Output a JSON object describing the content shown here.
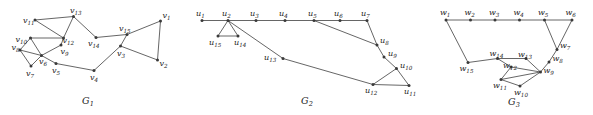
{
  "figure": {
    "width": 593,
    "height": 115,
    "background": "#ffffff",
    "edge_color": "#555555",
    "vertex_color": "#3a3a3a",
    "label_color": "#222222"
  },
  "graphs": [
    {
      "id": "G1",
      "caption_base": "G",
      "caption_sub": "1",
      "caption_x": 88,
      "caption_y": 104,
      "vertices": [
        {
          "name": "v1",
          "base": "v",
          "sub": "1",
          "x": 160.5,
          "y": 21.0,
          "lx": 162.5,
          "ly": 17.5,
          "anchor": "start"
        },
        {
          "name": "v2",
          "base": "v",
          "sub": "2",
          "x": 157.5,
          "y": 60.0,
          "lx": 159.5,
          "ly": 66.0,
          "anchor": "start"
        },
        {
          "name": "v3",
          "base": "v",
          "sub": "3",
          "x": 120.5,
          "y": 46.0,
          "lx": 117.0,
          "ly": 55.5,
          "anchor": "start"
        },
        {
          "name": "v4",
          "base": "v",
          "sub": "4",
          "x": 94.0,
          "y": 70.5,
          "lx": 90.0,
          "ly": 79.5,
          "anchor": "start"
        },
        {
          "name": "v5",
          "base": "v",
          "sub": "5",
          "x": 56.0,
          "y": 63.5,
          "lx": 52.0,
          "ly": 72.5,
          "anchor": "start"
        },
        {
          "name": "v6",
          "base": "v",
          "sub": "6",
          "x": 41.5,
          "y": 55.5,
          "lx": 39.0,
          "ly": 64.0,
          "anchor": "start"
        },
        {
          "name": "v7",
          "base": "v",
          "sub": "7",
          "x": 31.0,
          "y": 66.0,
          "lx": 26.0,
          "ly": 75.5,
          "anchor": "start"
        },
        {
          "name": "v8",
          "base": "v",
          "sub": "8",
          "x": 20.0,
          "y": 50.0,
          "lx": 11.5,
          "ly": 49.5,
          "anchor": "start"
        },
        {
          "name": "v9",
          "base": "v",
          "sub": "9",
          "x": 61.0,
          "y": 45.0,
          "lx": 60.5,
          "ly": 54.0,
          "anchor": "start"
        },
        {
          "name": "v10",
          "base": "v",
          "sub": "10",
          "x": 30.5,
          "y": 38.0,
          "lx": 15.5,
          "ly": 41.5,
          "anchor": "start"
        },
        {
          "name": "v11",
          "base": "v",
          "sub": "11",
          "x": 35.0,
          "y": 20.0,
          "lx": 23.0,
          "ly": 23.0,
          "anchor": "start"
        },
        {
          "name": "v12",
          "base": "v",
          "sub": "12",
          "x": 63.5,
          "y": 38.0,
          "lx": 62.5,
          "ly": 42.5,
          "anchor": "start"
        },
        {
          "name": "v13",
          "base": "v",
          "sub": "13",
          "x": 73.5,
          "y": 16.5,
          "lx": 70.0,
          "ly": 13.0,
          "anchor": "start"
        },
        {
          "name": "v14",
          "base": "v",
          "sub": "14",
          "x": 96.0,
          "y": 37.5,
          "lx": 88.0,
          "ly": 45.5,
          "anchor": "start"
        },
        {
          "name": "v15",
          "base": "v",
          "sub": "15",
          "x": 127.0,
          "y": 34.5,
          "lx": 119.0,
          "ly": 31.0,
          "anchor": "start"
        }
      ],
      "edges": [
        [
          "v11",
          "v13"
        ],
        [
          "v13",
          "v12"
        ],
        [
          "v11",
          "v12"
        ],
        [
          "v13",
          "v14"
        ],
        [
          "v14",
          "v15"
        ],
        [
          "v15",
          "v1"
        ],
        [
          "v1",
          "v2"
        ],
        [
          "v2",
          "v3"
        ],
        [
          "v3",
          "v15"
        ],
        [
          "v3",
          "v4"
        ],
        [
          "v4",
          "v5"
        ],
        [
          "v5",
          "v6"
        ],
        [
          "v6",
          "v7"
        ],
        [
          "v7",
          "v8"
        ],
        [
          "v8",
          "v6"
        ],
        [
          "v8",
          "v10"
        ],
        [
          "v10",
          "v12"
        ],
        [
          "v10",
          "v6"
        ],
        [
          "v6",
          "v9"
        ],
        [
          "v9",
          "v12"
        ]
      ]
    },
    {
      "id": "G2",
      "caption_base": "G",
      "caption_sub": "2",
      "caption_x": 307,
      "caption_y": 104,
      "vertices": [
        {
          "name": "u1",
          "base": "u",
          "sub": "1",
          "x": 202.0,
          "y": 20.5,
          "lx": 196.0,
          "ly": 15.5,
          "anchor": "start"
        },
        {
          "name": "u2",
          "base": "u",
          "sub": "2",
          "x": 228.0,
          "y": 20.5,
          "lx": 222.0,
          "ly": 15.5,
          "anchor": "start"
        },
        {
          "name": "u3",
          "base": "u",
          "sub": "3",
          "x": 256.0,
          "y": 20.5,
          "lx": 250.0,
          "ly": 15.5,
          "anchor": "start"
        },
        {
          "name": "u4",
          "base": "u",
          "sub": "4",
          "x": 285.0,
          "y": 20.5,
          "lx": 279.0,
          "ly": 15.5,
          "anchor": "start"
        },
        {
          "name": "u5",
          "base": "u",
          "sub": "5",
          "x": 314.0,
          "y": 20.5,
          "lx": 308.0,
          "ly": 15.5,
          "anchor": "start"
        },
        {
          "name": "u6",
          "base": "u",
          "sub": "6",
          "x": 340.0,
          "y": 20.5,
          "lx": 334.0,
          "ly": 15.5,
          "anchor": "start"
        },
        {
          "name": "u7",
          "base": "u",
          "sub": "7",
          "x": 367.0,
          "y": 20.5,
          "lx": 361.0,
          "ly": 15.5,
          "anchor": "start"
        },
        {
          "name": "u8",
          "base": "u",
          "sub": "8",
          "x": 377.0,
          "y": 45.0,
          "lx": 380.0,
          "ly": 43.0,
          "anchor": "start"
        },
        {
          "name": "u9",
          "base": "u",
          "sub": "9",
          "x": 384.0,
          "y": 57.0,
          "lx": 388.0,
          "ly": 56.0,
          "anchor": "start"
        },
        {
          "name": "u10",
          "base": "u",
          "sub": "10",
          "x": 396.5,
          "y": 68.5,
          "lx": 400.0,
          "ly": 68.0,
          "anchor": "start"
        },
        {
          "name": "u11",
          "base": "u",
          "sub": "11",
          "x": 409.0,
          "y": 85.5,
          "lx": 404.0,
          "ly": 94.0,
          "anchor": "start"
        },
        {
          "name": "u12",
          "base": "u",
          "sub": "12",
          "x": 373.0,
          "y": 84.5,
          "lx": 365.0,
          "ly": 93.0,
          "anchor": "start"
        },
        {
          "name": "u13",
          "base": "u",
          "sub": "13",
          "x": 283.0,
          "y": 58.5,
          "lx": 264.0,
          "ly": 60.0,
          "anchor": "start"
        },
        {
          "name": "u14",
          "base": "u",
          "sub": "14",
          "x": 238.0,
          "y": 36.0,
          "lx": 234.0,
          "ly": 45.0,
          "anchor": "start"
        },
        {
          "name": "u15",
          "base": "u",
          "sub": "15",
          "x": 218.0,
          "y": 36.0,
          "lx": 209.0,
          "ly": 45.0,
          "anchor": "start"
        }
      ],
      "edges": [
        [
          "u1",
          "u2"
        ],
        [
          "u2",
          "u3"
        ],
        [
          "u3",
          "u4"
        ],
        [
          "u4",
          "u5"
        ],
        [
          "u5",
          "u6"
        ],
        [
          "u6",
          "u7"
        ],
        [
          "u7",
          "u8"
        ],
        [
          "u8",
          "u9"
        ],
        [
          "u9",
          "u10"
        ],
        [
          "u10",
          "u11"
        ],
        [
          "u11",
          "u12"
        ],
        [
          "u12",
          "u10"
        ],
        [
          "u12",
          "u13"
        ],
        [
          "u13",
          "u2"
        ],
        [
          "u2",
          "u14"
        ],
        [
          "u2",
          "u15"
        ],
        [
          "u14",
          "u15"
        ],
        [
          "u5",
          "u8"
        ]
      ]
    },
    {
      "id": "G3",
      "caption_base": "G",
      "caption_sub": "3",
      "caption_x": 514,
      "caption_y": 105,
      "vertices": [
        {
          "name": "w1",
          "base": "w",
          "sub": "1",
          "x": 446.0,
          "y": 20.0,
          "lx": 440.0,
          "ly": 15.0,
          "anchor": "start"
        },
        {
          "name": "w2",
          "base": "w",
          "sub": "2",
          "x": 470.5,
          "y": 20.0,
          "lx": 464.5,
          "ly": 15.0,
          "anchor": "start"
        },
        {
          "name": "w3",
          "base": "w",
          "sub": "3",
          "x": 495.0,
          "y": 20.0,
          "lx": 489.0,
          "ly": 15.0,
          "anchor": "start"
        },
        {
          "name": "w4",
          "base": "w",
          "sub": "4",
          "x": 519.5,
          "y": 20.0,
          "lx": 513.5,
          "ly": 15.0,
          "anchor": "start"
        },
        {
          "name": "w5",
          "base": "w",
          "sub": "5",
          "x": 544.5,
          "y": 20.0,
          "lx": 538.0,
          "ly": 15.0,
          "anchor": "start"
        },
        {
          "name": "w6",
          "base": "w",
          "sub": "6",
          "x": 572.0,
          "y": 20.0,
          "lx": 565.5,
          "ly": 15.0,
          "anchor": "start"
        },
        {
          "name": "w7",
          "base": "w",
          "sub": "7",
          "x": 557.0,
          "y": 49.5,
          "lx": 560.0,
          "ly": 48.0,
          "anchor": "start"
        },
        {
          "name": "w8",
          "base": "w",
          "sub": "8",
          "x": 549.0,
          "y": 62.0,
          "lx": 552.5,
          "ly": 61.0,
          "anchor": "start"
        },
        {
          "name": "w9",
          "base": "w",
          "sub": "9",
          "x": 540.5,
          "y": 72.0,
          "lx": 543.5,
          "ly": 72.5,
          "anchor": "start"
        },
        {
          "name": "w10",
          "base": "w",
          "sub": "10",
          "x": 520.0,
          "y": 86.0,
          "lx": 514.0,
          "ly": 94.5,
          "anchor": "start"
        },
        {
          "name": "w11",
          "base": "w",
          "sub": "11",
          "x": 501.0,
          "y": 79.5,
          "lx": 493.0,
          "ly": 87.5,
          "anchor": "start"
        },
        {
          "name": "w12",
          "base": "w",
          "sub": "12",
          "x": 511.0,
          "y": 67.0,
          "lx": 503.0,
          "ly": 68.0,
          "anchor": "start"
        },
        {
          "name": "w13",
          "base": "w",
          "sub": "13",
          "x": 526.0,
          "y": 58.5,
          "lx": 518.0,
          "ly": 57.0,
          "anchor": "start"
        },
        {
          "name": "w14",
          "base": "w",
          "sub": "14",
          "x": 497.5,
          "y": 58.5,
          "lx": 489.5,
          "ly": 56.0,
          "anchor": "start"
        },
        {
          "name": "w15",
          "base": "w",
          "sub": "15",
          "x": 468.0,
          "y": 62.5,
          "lx": 459.5,
          "ly": 71.0,
          "anchor": "start"
        }
      ],
      "edges": [
        [
          "w1",
          "w2"
        ],
        [
          "w2",
          "w3"
        ],
        [
          "w3",
          "w4"
        ],
        [
          "w4",
          "w5"
        ],
        [
          "w5",
          "w6"
        ],
        [
          "w5",
          "w7"
        ],
        [
          "w6",
          "w7"
        ],
        [
          "w7",
          "w8"
        ],
        [
          "w8",
          "w9"
        ],
        [
          "w9",
          "w10"
        ],
        [
          "w10",
          "w11"
        ],
        [
          "w11",
          "w12"
        ],
        [
          "w12",
          "w14"
        ],
        [
          "w14",
          "w13"
        ],
        [
          "w13",
          "w9"
        ],
        [
          "w12",
          "w9"
        ],
        [
          "w11",
          "w9"
        ],
        [
          "w14",
          "w15"
        ],
        [
          "w15",
          "w1"
        ]
      ]
    }
  ]
}
